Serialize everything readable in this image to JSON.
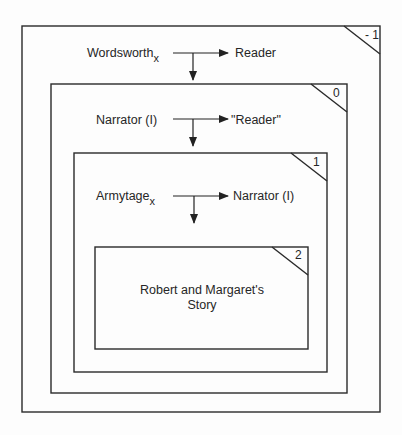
{
  "frames": [
    {
      "level": "- 1",
      "sender": "Wordsworth",
      "sender_subscript": "x",
      "receiver": "Reader"
    },
    {
      "level": "0",
      "sender": "Narrator (I)",
      "sender_subscript": "",
      "receiver": "\"Reader\""
    },
    {
      "level": "1",
      "sender": "Armytage",
      "sender_subscript": "x",
      "receiver": "Narrator (I)"
    },
    {
      "level": "2",
      "story_line1": "Robert and Margaret's",
      "story_line2": "Story"
    }
  ],
  "colors": {
    "line": "#2a2a2a",
    "background": "#fdfdfd"
  }
}
